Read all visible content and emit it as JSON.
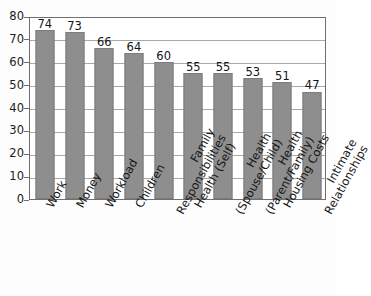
{
  "chart_data": {
    "type": "bar",
    "title": "",
    "subtitle": "",
    "xlabel": "",
    "ylabel": "",
    "ylim": [
      0,
      80
    ],
    "ytick_step": 10,
    "yticks": [
      "0",
      "10",
      "20",
      "30",
      "40",
      "50",
      "60",
      "70",
      "80"
    ],
    "grid": true,
    "grid_axis": "y",
    "legend": "none",
    "bar_color": "#8e8e8e",
    "bar_edge_color": "#7d7d7d",
    "axis_color": "#6f6f6f",
    "grid_color": "#a8a8a8",
    "background": "#ffffff",
    "show_data_labels": true,
    "categories": [
      "Work",
      "Money",
      "Workload",
      "Children",
      "Family Responsibilities",
      "Health (Self)",
      "Health (Spouse/Child)",
      "Health (Parent/Family)",
      "Housing Costs",
      "Intimate Relationships"
    ],
    "category_lines": [
      [
        "Work"
      ],
      [
        "Money"
      ],
      [
        "Workload"
      ],
      [
        "Children"
      ],
      [
        "Family",
        "Responsibilities"
      ],
      [
        "Health (Self)"
      ],
      [
        "Health",
        "(Spouse/Child)"
      ],
      [
        "Health",
        "(Parent/Family)"
      ],
      [
        "Housing Costs"
      ],
      [
        "Intimate",
        "Relationships"
      ]
    ],
    "values": [
      74,
      73,
      66,
      64,
      60,
      55,
      55,
      53,
      51,
      47
    ],
    "value_labels": [
      "74",
      "73",
      "66",
      "64",
      "60",
      "55",
      "55",
      "53",
      "51",
      "47"
    ]
  }
}
